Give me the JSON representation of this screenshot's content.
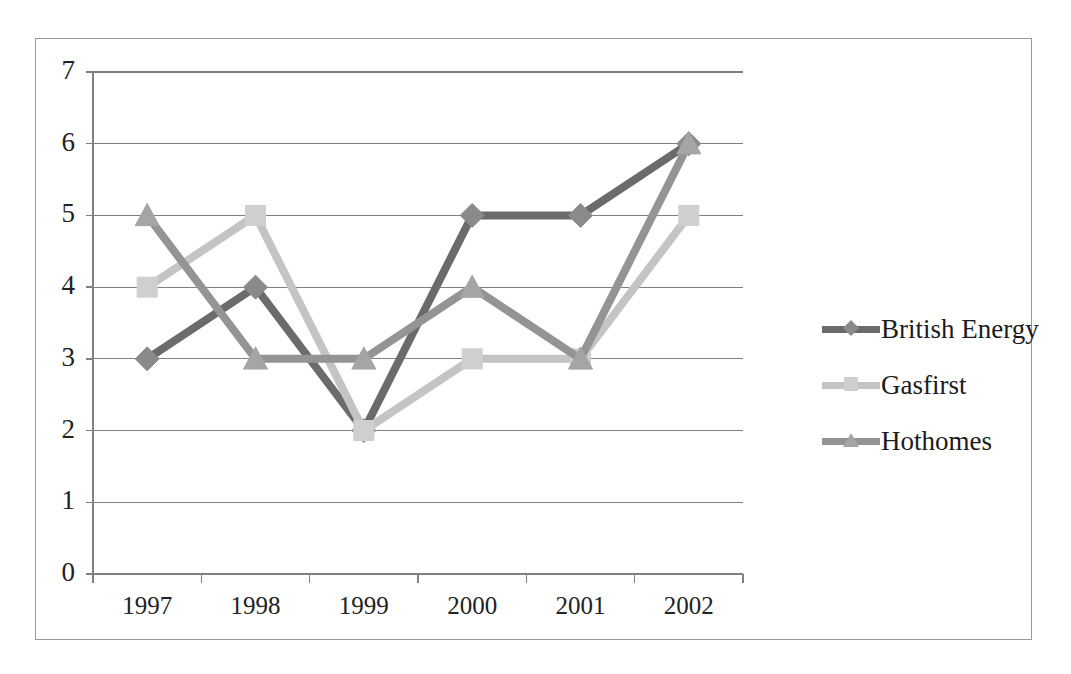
{
  "chart_data": {
    "type": "line",
    "title": "",
    "subtitle": "",
    "xlabel": "",
    "ylabel": "",
    "categories": [
      "1997",
      "1998",
      "1999",
      "2000",
      "2001",
      "2002"
    ],
    "series": [
      {
        "name": "British Energy",
        "values": [
          3,
          4,
          2,
          5,
          5,
          6
        ],
        "color": "#6b6b6b",
        "marker": "diamond",
        "marker_color": "#8a8a8a"
      },
      {
        "name": "Gasfirst",
        "values": [
          4,
          5,
          2,
          3,
          3,
          5
        ],
        "color": "#c4c4c4",
        "marker": "square",
        "marker_color": "#cfcfcf"
      },
      {
        "name": "Hothomes",
        "values": [
          5,
          3,
          3,
          4,
          3,
          6
        ],
        "color": "#949494",
        "marker": "triangle",
        "marker_color": "#a5a5a5"
      }
    ],
    "ylim": [
      0,
      7
    ],
    "y_ticks": [
      "0",
      "1",
      "2",
      "3",
      "4",
      "5",
      "6",
      "7"
    ],
    "x_ticks": [
      "1997",
      "1998",
      "1999",
      "2000",
      "2001",
      "2002"
    ],
    "grid": true,
    "grid_axis": "y",
    "grid_color": "#808080",
    "legend_position": "right",
    "legend_entries": [
      "British Energy",
      "Gasfirst",
      "Hothomes"
    ],
    "axis_color": "#808080",
    "frame_color": "#9a9a9a",
    "background": "#ffffff"
  }
}
